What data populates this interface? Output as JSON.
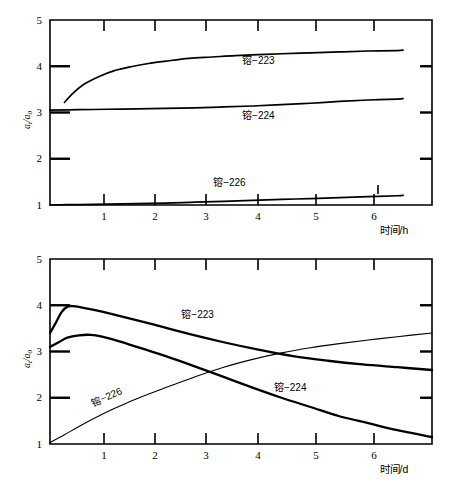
{
  "figure": {
    "panels": [
      {
        "id": "top",
        "ylabel": "a t /a 0",
        "ylabel_main": "a",
        "ylabel_sub1": "t",
        "ylabel_slash": "/a",
        "ylabel_sub2": "0",
        "xaxis_title": "时间/h",
        "yticks": [
          "1",
          "2",
          "3",
          "4",
          "5"
        ],
        "xticks": [
          "1",
          "2",
          "3",
          "4",
          "5",
          "6"
        ],
        "series_labels": [
          "镕−223",
          "镕−224",
          "镕−226"
        ]
      },
      {
        "id": "bottom",
        "ylabel": "a t /a 0",
        "ylabel_main": "a",
        "ylabel_sub1": "t",
        "ylabel_slash": "/a",
        "ylabel_sub2": "0",
        "xaxis_title": "时间/d",
        "yticks": [
          "1",
          "2",
          "3",
          "4",
          "5"
        ],
        "xticks": [
          "1",
          "2",
          "3",
          "4",
          "5",
          "6"
        ],
        "series_labels": [
          "镕−223",
          "镕−224",
          "镕−226"
        ]
      }
    ]
  },
  "chart_data": [
    {
      "type": "line",
      "id": "top-panel",
      "title": "",
      "xlabel": "时间/h",
      "ylabel": "a_t/a_0",
      "xlim": [
        0,
        6.6
      ],
      "ylim": [
        1,
        5
      ],
      "xticks": [
        1,
        2,
        3,
        4,
        5,
        6
      ],
      "yticks": [
        1,
        2,
        3,
        4,
        5
      ],
      "grid": false,
      "legend": "inline-annotations",
      "series": [
        {
          "name": "镕−223",
          "label_x": 3.6,
          "label_y": 4.05,
          "x": [
            0.25,
            0.4,
            0.6,
            0.85,
            1.1,
            1.4,
            1.7,
            2.0,
            2.4,
            2.8,
            3.2,
            3.6,
            4.0,
            4.5,
            5.0,
            5.5,
            6.0,
            6.1
          ],
          "y": [
            3.22,
            3.42,
            3.62,
            3.78,
            3.9,
            3.99,
            4.06,
            4.11,
            4.17,
            4.2,
            4.23,
            4.25,
            4.27,
            4.29,
            4.31,
            4.33,
            4.34,
            4.35
          ]
        },
        {
          "name": "镕−224",
          "label_x": 3.6,
          "label_y": 2.85,
          "x": [
            0.0,
            0.5,
            1.0,
            1.5,
            2.0,
            2.5,
            3.0,
            3.5,
            4.0,
            4.5,
            5.0,
            5.5,
            6.0,
            6.1
          ],
          "y": [
            3.05,
            3.06,
            3.07,
            3.08,
            3.09,
            3.1,
            3.12,
            3.14,
            3.17,
            3.2,
            3.24,
            3.27,
            3.29,
            3.3
          ]
        },
        {
          "name": "镕−226",
          "label_x": 3.1,
          "label_y": 1.42,
          "x": [
            0.0,
            0.5,
            1.0,
            1.5,
            2.0,
            2.5,
            3.0,
            3.5,
            4.0,
            4.5,
            5.0,
            5.5,
            6.0,
            6.1
          ],
          "y": [
            1.0,
            1.01,
            1.02,
            1.03,
            1.04,
            1.06,
            1.08,
            1.1,
            1.12,
            1.14,
            1.16,
            1.18,
            1.2,
            1.21
          ]
        }
      ]
    },
    {
      "type": "line",
      "id": "bottom-panel",
      "title": "",
      "xlabel": "时间/d",
      "ylabel": "a_t/a_0",
      "xlim": [
        0,
        6.6
      ],
      "ylim": [
        1,
        5
      ],
      "xticks": [
        1,
        2,
        3,
        4,
        5,
        6
      ],
      "yticks": [
        1,
        2,
        3,
        4,
        5
      ],
      "grid": false,
      "legend": "inline-annotations",
      "series": [
        {
          "name": "镕−223",
          "label_x": 2.55,
          "label_y": 3.72,
          "x": [
            0.0,
            0.1,
            0.2,
            0.3,
            0.4,
            0.6,
            0.9,
            1.3,
            1.8,
            2.4,
            3.0,
            3.6,
            4.2,
            4.8,
            5.4,
            6.0,
            6.6
          ],
          "y": [
            3.4,
            3.62,
            3.85,
            3.97,
            3.98,
            3.94,
            3.86,
            3.74,
            3.58,
            3.38,
            3.2,
            3.04,
            2.9,
            2.8,
            2.72,
            2.66,
            2.6
          ]
        },
        {
          "name": "镕−224",
          "label_x": 4.15,
          "label_y": 2.15,
          "x": [
            0.0,
            0.15,
            0.3,
            0.5,
            0.7,
            0.9,
            1.2,
            1.6,
            2.0,
            2.5,
            3.0,
            3.5,
            4.0,
            4.5,
            5.0,
            5.5,
            6.0,
            6.6
          ],
          "y": [
            3.1,
            3.2,
            3.3,
            3.35,
            3.36,
            3.32,
            3.22,
            3.06,
            2.9,
            2.68,
            2.45,
            2.22,
            2.0,
            1.8,
            1.6,
            1.45,
            1.3,
            1.15
          ]
        },
        {
          "name": "镕−226",
          "label_x": 1.0,
          "label_y": 1.95,
          "x": [
            0.0,
            0.25,
            0.5,
            0.8,
            1.1,
            1.5,
            2.0,
            2.5,
            3.0,
            3.5,
            4.0,
            4.5,
            5.0,
            5.5,
            6.0,
            6.6
          ],
          "y": [
            1.03,
            1.2,
            1.38,
            1.58,
            1.76,
            1.98,
            2.22,
            2.45,
            2.66,
            2.83,
            2.97,
            3.08,
            3.17,
            3.25,
            3.32,
            3.4
          ]
        }
      ]
    }
  ]
}
